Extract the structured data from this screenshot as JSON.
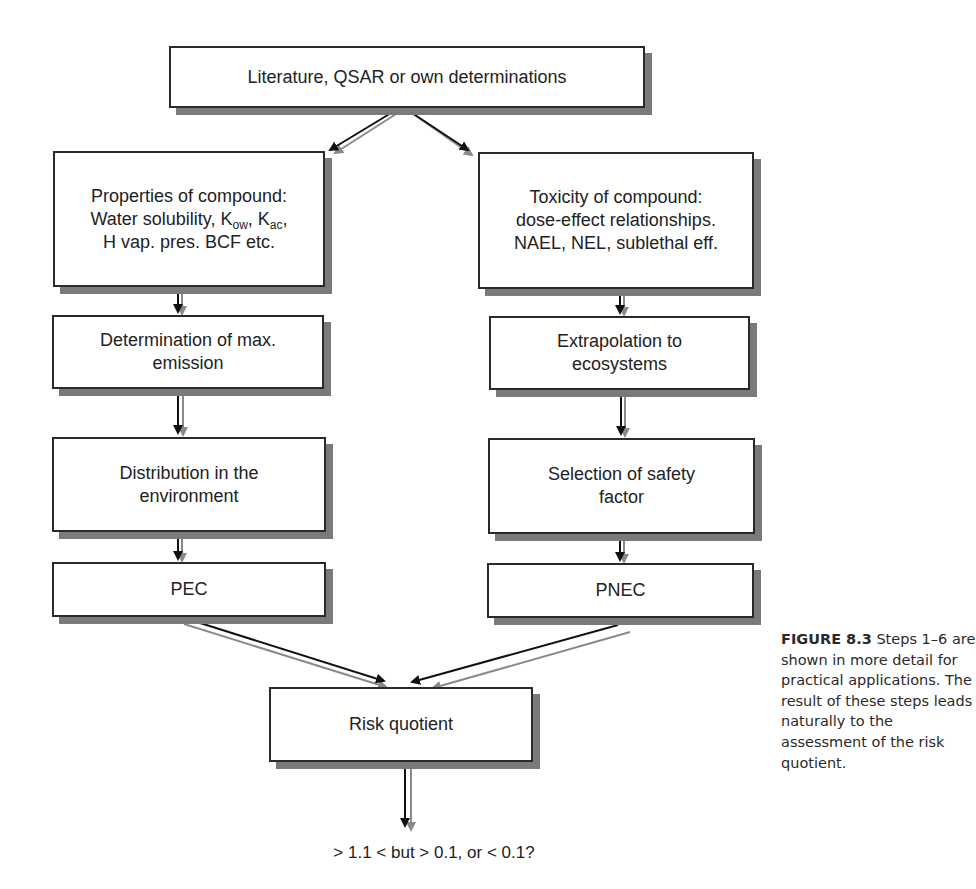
{
  "figure": {
    "caption_label": "FIGURE 8.3",
    "caption_text": " Steps 1–6 are shown in more detail for practical applications. The result of these steps leads naturally to the assessment of the risk quotient."
  },
  "diagram": {
    "top": {
      "text": "Literature, QSAR or own determinations"
    },
    "left_column": [
      {
        "id": "properties",
        "lines": [
          "Properties of compound:",
          "Water solubility, K",
          "ow",
          ", K",
          "ac",
          ",",
          "H vap. pres. BCF etc."
        ],
        "line1": "Properties of compound:",
        "line2_prefix": "Water solubility, K",
        "line2_sub1": "ow",
        "line2_mid": ", K",
        "line2_sub2": "ac",
        "line2_suffix": ",",
        "line3": "H vap. pres. BCF etc."
      },
      {
        "id": "max-emission",
        "line1": "Determination of max.",
        "line2": "emission"
      },
      {
        "id": "distribution",
        "line1": "Distribution in the",
        "line2": "environment"
      },
      {
        "id": "pec",
        "line1": "PEC"
      }
    ],
    "right_column": [
      {
        "id": "toxicity",
        "line1": "Toxicity of compound:",
        "line2": "dose-effect relationships.",
        "line3": "NAEL, NEL, sublethal eff."
      },
      {
        "id": "extrapolation",
        "line1": "Extrapolation to",
        "line2": "ecosystems"
      },
      {
        "id": "safety-factor",
        "line1": "Selection of safety",
        "line2": "factor"
      },
      {
        "id": "pnec",
        "line1": "PNEC"
      }
    ],
    "bottom": {
      "text": "Risk quotient"
    },
    "result": {
      "text": "> 1.1 < but > 0.1, or < 0.1?"
    },
    "colors": {
      "border": "#2a2a2a",
      "shadow": "#7a7a7a",
      "arrow_dark": "#111111",
      "arrow_light": "#8a8a8a"
    }
  }
}
